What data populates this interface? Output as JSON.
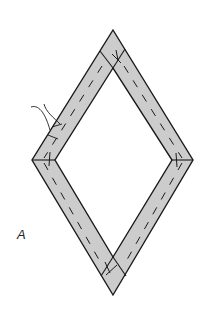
{
  "figure": {
    "label": "A",
    "colors": {
      "strip_fill": "#cccccc",
      "outline": "#1a1a1a",
      "background": "#ffffff"
    }
  }
}
